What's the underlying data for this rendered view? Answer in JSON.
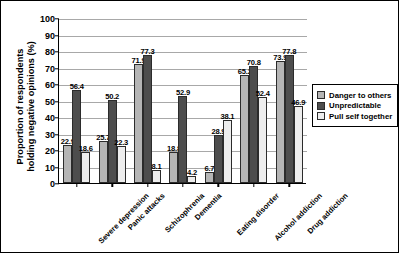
{
  "chart_data": {
    "type": "bar",
    "title": "",
    "xlabel": "",
    "ylabel": "Proportion of respondents\nholding negative opinions (%)",
    "ylim": [
      0,
      100
    ],
    "yticks": [
      0,
      10,
      20,
      30,
      40,
      50,
      60,
      70,
      80,
      90,
      100
    ],
    "grid": true,
    "legend_position": "right",
    "categories": [
      "Severe depression",
      "Panic attacks",
      "Schizophrenia",
      "Dementia",
      "Eating disorder",
      "Alcohol addiction",
      "Drug addiction"
    ],
    "series": [
      {
        "name": "Danger to others",
        "color": "#b5b5b5",
        "values": [
          22.9,
          25.7,
          71.9,
          18.8,
          6.7,
          65.2,
          73.9
        ]
      },
      {
        "name": "Unpredictable",
        "color": "#4d4d4d",
        "values": [
          56.4,
          50.2,
          77.3,
          52.9,
          28.9,
          70.8,
          77.8
        ]
      },
      {
        "name": "Pull self together",
        "color": "#ededed",
        "values": [
          18.6,
          22.3,
          8.1,
          4.2,
          38.1,
          52.4,
          46.9
        ]
      }
    ]
  }
}
